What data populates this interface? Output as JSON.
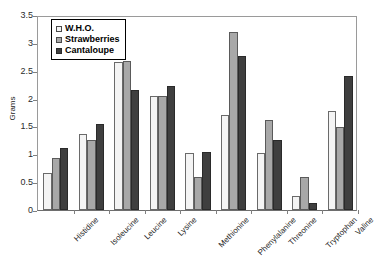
{
  "chart_data": {
    "type": "bar",
    "title": "",
    "xlabel": "",
    "ylabel": "Grams",
    "ylim": [
      0,
      3.5
    ],
    "ytick_step": 0.5,
    "yticks": [
      "0",
      "0.5",
      "1",
      "1.5",
      "2",
      "2.5",
      "3",
      "3.5"
    ],
    "grid": false,
    "legend_position": "top-left",
    "categories": [
      "Histidine",
      "Isoleucine",
      "Leucine",
      "Lysine",
      "Methionine",
      "Phenylalanine",
      "Threonine",
      "Tryptophan",
      "Valine"
    ],
    "series": [
      {
        "name": "W.H.O.",
        "color": "#f4f4f4",
        "values": [
          0.66,
          1.37,
          2.66,
          2.04,
          1.02,
          1.71,
          1.02,
          0.25,
          1.78
        ]
      },
      {
        "name": "Strawberries",
        "color": "#a8a8a8",
        "values": [
          0.93,
          1.25,
          2.68,
          2.04,
          0.6,
          3.2,
          1.62,
          0.59,
          1.49
        ]
      },
      {
        "name": "Cantaloupe",
        "color": "#3f3f3f",
        "values": [
          1.12,
          1.55,
          2.15,
          2.22,
          1.04,
          2.77,
          1.25,
          0.13,
          2.41
        ]
      }
    ]
  },
  "caption": {
    "text": ""
  }
}
